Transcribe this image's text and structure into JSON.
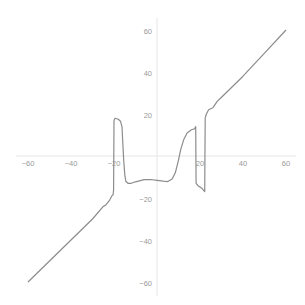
{
  "chart_data": {
    "type": "line",
    "title": "",
    "xlabel": "",
    "ylabel": "",
    "xlim": [
      -60,
      60
    ],
    "ylim": [
      -60,
      60
    ],
    "grid": false,
    "legend": null,
    "x_ticks": [
      -60,
      -40,
      -20,
      20,
      40,
      60
    ],
    "y_ticks": [
      60,
      40,
      20,
      -20,
      -40,
      -60
    ],
    "x_tick_labels": [
      "−60",
      "−40",
      "−20",
      "20",
      "40",
      "60"
    ],
    "y_tick_labels": [
      "60",
      "40",
      "20",
      "−20",
      "−40",
      "−60"
    ],
    "colors": {
      "curve": "#8c8c8c",
      "axes": "#e6e6e6",
      "tick_labels": "#9a9a9a"
    },
    "series": [
      {
        "name": "f(x)",
        "points": [
          [
            -60,
            -60
          ],
          [
            -50,
            -50
          ],
          [
            -40,
            -40
          ],
          [
            -30,
            -30
          ],
          [
            -25,
            -24
          ],
          [
            -24,
            -23.5
          ],
          [
            -22,
            -21
          ],
          [
            -21,
            -19
          ],
          [
            -20.4,
            -18.5
          ],
          [
            -20.2,
            -16
          ],
          [
            -20,
            17
          ],
          [
            -19.5,
            18
          ],
          [
            -18,
            17.5
          ],
          [
            -17,
            16.5
          ],
          [
            -16.3,
            14
          ],
          [
            -16,
            8
          ],
          [
            -15.5,
            -2
          ],
          [
            -15,
            -9
          ],
          [
            -14.5,
            -12
          ],
          [
            -13.5,
            -13
          ],
          [
            -12,
            -13
          ],
          [
            -10,
            -12.3
          ],
          [
            -6,
            -11.3
          ],
          [
            -3,
            -11.2
          ],
          [
            0,
            -11.6
          ],
          [
            3,
            -12
          ],
          [
            5,
            -12.2
          ],
          [
            7,
            -11
          ],
          [
            8.5,
            -8
          ],
          [
            10,
            -2
          ],
          [
            11,
            3
          ],
          [
            12.5,
            8
          ],
          [
            14,
            11
          ],
          [
            16,
            12.5
          ],
          [
            17.5,
            13
          ],
          [
            18,
            14
          ],
          [
            18.2,
            -13
          ],
          [
            19,
            -14
          ],
          [
            21,
            -15.5
          ],
          [
            22.2,
            -17
          ],
          [
            22.4,
            18
          ],
          [
            23,
            20
          ],
          [
            24,
            22
          ],
          [
            26,
            23
          ],
          [
            28,
            26
          ],
          [
            30,
            28
          ],
          [
            35,
            33
          ],
          [
            40,
            38
          ],
          [
            50,
            49
          ],
          [
            60,
            60
          ]
        ]
      }
    ]
  }
}
